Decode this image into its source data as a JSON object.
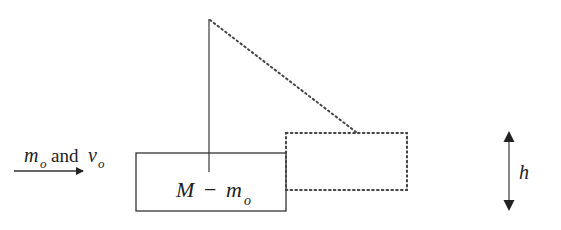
{
  "diagram": {
    "type": "ballistic-pendulum",
    "colors": {
      "ink": "#333333",
      "background": "#ffffff"
    },
    "projectile_label": {
      "mass": "m",
      "mass_subscript": "o",
      "conjunction": "and",
      "velocity": "v",
      "velocity_subscript": "o"
    },
    "block_label": {
      "mass": "M",
      "operator": "−",
      "sub_mass": "m",
      "sub_mass_subscript": "o"
    },
    "height_label": "h",
    "elements": {
      "initial_block": "solid rectangle",
      "displaced_block": "dotted rectangle",
      "string_rest": "solid vertical line",
      "string_swung": "dotted diagonal line",
      "height_indicator": "double-headed vertical arrow",
      "velocity_arrow": "right-pointing arrow"
    }
  }
}
